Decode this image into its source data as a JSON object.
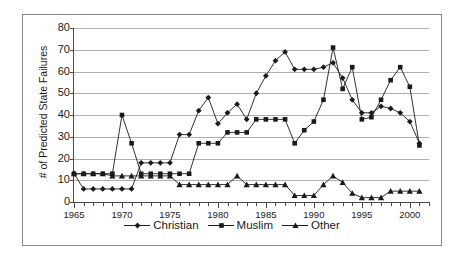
{
  "chart_data": {
    "type": "line",
    "title": "",
    "xlabel": "",
    "ylabel": "# of Predicted State Failures",
    "xlim": [
      1965,
      2002
    ],
    "ylim": [
      0,
      80
    ],
    "ytick_values": [
      0,
      10,
      20,
      30,
      40,
      50,
      60,
      70,
      80
    ],
    "xtick_labels": [
      "1965",
      "1970",
      "1975",
      "1980",
      "1985",
      "1990",
      "1995",
      "2000"
    ],
    "xtick_values": [
      1965,
      1970,
      1975,
      1980,
      1985,
      1990,
      1995,
      2000
    ],
    "minor_xticks": "every year",
    "grid": "horizontal",
    "legend_position": "bottom-center",
    "x": [
      1965,
      1966,
      1967,
      1968,
      1969,
      1970,
      1971,
      1972,
      1973,
      1974,
      1975,
      1976,
      1977,
      1978,
      1979,
      1980,
      1981,
      1982,
      1983,
      1984,
      1985,
      1986,
      1987,
      1988,
      1989,
      1990,
      1991,
      1992,
      1993,
      1994,
      1995,
      1996,
      1997,
      1998,
      1999,
      2000,
      2001
    ],
    "series": [
      {
        "name": "Christian",
        "marker": "diamond",
        "color": "#1a1a1a",
        "values": [
          13,
          6,
          6,
          6,
          6,
          6,
          6,
          18,
          18,
          18,
          18,
          31,
          31,
          42,
          48,
          36,
          41,
          45,
          38,
          50,
          58,
          65,
          69,
          61,
          61,
          61,
          62,
          64,
          57,
          47,
          41,
          41,
          44,
          43,
          41,
          37,
          27
        ]
      },
      {
        "name": "Muslim",
        "marker": "square",
        "color": "#1a1a1a",
        "values": [
          13,
          13,
          13,
          13,
          13,
          40,
          27,
          13,
          13,
          13,
          13,
          13,
          13,
          27,
          27,
          27,
          32,
          32,
          32,
          38,
          38,
          38,
          38,
          27,
          33,
          37,
          47,
          71,
          52,
          62,
          38,
          39,
          47,
          56,
          62,
          53,
          26
        ]
      },
      {
        "name": "Other",
        "marker": "triangle",
        "color": "#1a1a1a",
        "values": [
          13,
          13,
          13,
          13,
          12,
          12,
          12,
          12,
          12,
          12,
          12,
          8,
          8,
          8,
          8,
          8,
          8,
          12,
          8,
          8,
          8,
          8,
          8,
          3,
          3,
          3,
          8,
          12,
          9,
          4,
          2,
          2,
          2,
          5,
          5,
          5,
          5
        ]
      }
    ]
  },
  "legend": {
    "entries": [
      {
        "label": "Christian",
        "marker": "diamond"
      },
      {
        "label": "Muslim",
        "marker": "square"
      },
      {
        "label": "Other",
        "marker": "triangle"
      }
    ]
  }
}
